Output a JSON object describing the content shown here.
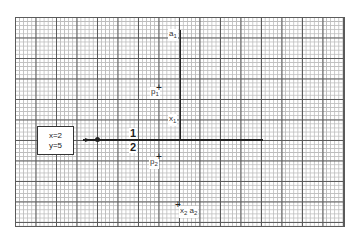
{
  "diagram": {
    "type": "graph-paper-signal-diagram",
    "grid": {
      "minor_spacing_px": 4,
      "major_every": 5
    },
    "input_box": {
      "line1": "x=2",
      "line2": "y=5"
    },
    "fraction": {
      "numerator": "1",
      "denominator": "2"
    },
    "labels": {
      "a1": {
        "base": "a",
        "sub": "1"
      },
      "p1": {
        "base": "p",
        "sub": "1"
      },
      "x1": {
        "base": "x",
        "sub": "1"
      },
      "p2": {
        "base": "p",
        "sub": "2"
      },
      "x2": {
        "base": "x",
        "sub": "2"
      },
      "a2": {
        "base": "a",
        "sub": "2"
      }
    },
    "markers": {
      "plus": "+"
    }
  }
}
